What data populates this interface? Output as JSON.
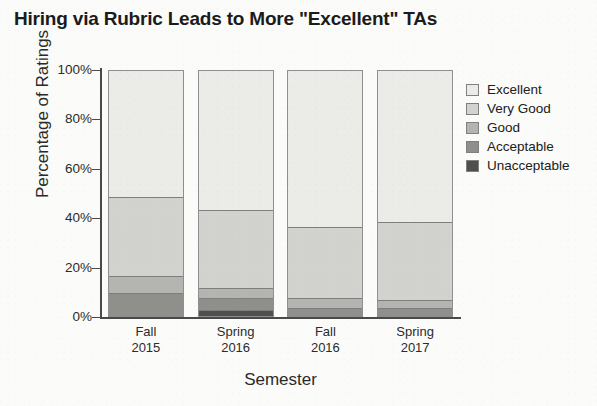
{
  "chart_data": {
    "type": "bar",
    "subtype": "stacked-100-percent",
    "title": "Hiring via Rubric Leads to More \"Excellent\" TAs",
    "xlabel": "Semester",
    "ylabel": "Percentage of Ratings",
    "categories": [
      "Fall\n2015",
      "Spring\n2016",
      "Fall\n2016",
      "Spring\n2017"
    ],
    "category_lines": [
      {
        "line1": "Fall",
        "line2": "2015"
      },
      {
        "line1": "Spring",
        "line2": "2016"
      },
      {
        "line1": "Fall",
        "line2": "2016"
      },
      {
        "line1": "Spring",
        "line2": "2017"
      }
    ],
    "ylim": [
      0,
      100
    ],
    "yticks": [
      0,
      20,
      40,
      60,
      80,
      100
    ],
    "ytick_labels": [
      "0%",
      "20%",
      "40%",
      "60%",
      "80%",
      "100%"
    ],
    "grid": false,
    "legend_position": "right",
    "series": [
      {
        "name": "Excellent",
        "color": "#ebebe7",
        "values": [
          52,
          57,
          64,
          62
        ]
      },
      {
        "name": "Very Good",
        "color": "#d2d2ce",
        "values": [
          32,
          32,
          29,
          32
        ]
      },
      {
        "name": "Good",
        "color": "#b4b4b0",
        "values": [
          7,
          4,
          4,
          3
        ]
      },
      {
        "name": "Acceptable",
        "color": "#8f8f8c",
        "values": [
          9,
          5,
          3,
          3
        ]
      },
      {
        "name": "Unacceptable",
        "color": "#4f4f4d",
        "values": [
          0,
          2,
          0,
          0
        ]
      }
    ],
    "cumulative_tops": {
      "note": "Top edge of each stacked category, percent from baseline",
      "Fall 2015": {
        "Unacceptable": 0,
        "Acceptable": 9,
        "Good": 16,
        "Very Good": 48,
        "Excellent": 100
      },
      "Spring 2016": {
        "Unacceptable": 2,
        "Acceptable": 7,
        "Good": 11,
        "Very Good": 43,
        "Excellent": 100
      },
      "Fall 2016": {
        "Unacceptable": 0,
        "Acceptable": 3,
        "Good": 7,
        "Very Good": 36,
        "Excellent": 100
      },
      "Spring 2017": {
        "Unacceptable": 0,
        "Acceptable": 3,
        "Good": 6,
        "Very Good": 38,
        "Excellent": 100
      }
    }
  },
  "legend": {
    "items": [
      {
        "label": "Excellent"
      },
      {
        "label": "Very Good"
      },
      {
        "label": "Good"
      },
      {
        "label": "Acceptable"
      },
      {
        "label": "Unacceptable"
      }
    ]
  },
  "colors": {
    "background": "#fbfbf9",
    "axis": "#4a4a4a",
    "text": "#202020",
    "segment_border": "#7e7e7e"
  }
}
